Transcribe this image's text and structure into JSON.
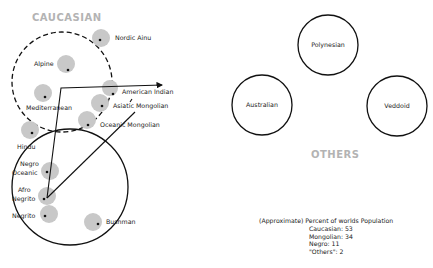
{
  "groups": {
    "caucasian": {
      "title": "CAUCASIAN"
    },
    "others": {
      "title": "OTHERS"
    }
  },
  "nodes": {
    "nordic_ainu": "Nordic Ainu",
    "alpine": "Alpine",
    "mediterranean": "Mediterranean",
    "american_indian": "American Indian",
    "asiatic_mongolian": "Asiatic Mongolian",
    "oceanic_mongolian": "Oceanic Mongolian",
    "hindu": "Hindu",
    "negro_oceanic_1": "Negro",
    "negro_oceanic_2": "Oceanic",
    "afro_negrito_1": "Afro",
    "afro_negrito_2": "Negrito",
    "negrito": "Negrito",
    "bushman": "Bushman",
    "polynesian": "Polynesian",
    "australian": "Australian",
    "veddoid": "Veddoid"
  },
  "population": {
    "heading": "(Approximate) Percent of worlds Population",
    "rows": [
      "Caucasian: 53",
      "Mongolian:  34",
      "Negro:  11",
      "\"Others\":  2"
    ]
  },
  "colors": {
    "node_fill": "#c8c8c8",
    "header_gray": "#b3b3b3",
    "line": "#111111"
  }
}
